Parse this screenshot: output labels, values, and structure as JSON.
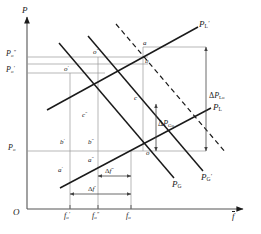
{
  "figure": {
    "type": "economics-supply-demand-diagram",
    "axes": {
      "y_label": "P",
      "x_label": "f",
      "x_label_overbar": true,
      "origin_label": "O"
    },
    "y_ticks": [
      {
        "id": "Po_dprime",
        "base": "P",
        "sub": "o",
        "prime": "″",
        "value_y": 57
      },
      {
        "id": "Po_prime",
        "base": "P",
        "sub": "o",
        "prime": "′",
        "value_y": 73
      },
      {
        "id": "Po",
        "base": "P",
        "sub": "o",
        "prime": "",
        "value_y": 148
      }
    ],
    "x_ticks": [
      {
        "id": "fo_prime",
        "base": "f",
        "sub": "o",
        "prime": "′",
        "value_x": 70
      },
      {
        "id": "fo_dprime",
        "base": "f",
        "sub": "o",
        "prime": "″",
        "value_x": 98
      },
      {
        "id": "fo",
        "base": "f",
        "sub": "o",
        "prime": "",
        "value_x": 131
      }
    ],
    "curves": [
      {
        "name": "PL_prime",
        "label_base": "P",
        "label_sub": "L",
        "label_prime": "′",
        "style": "solid",
        "slope": "upward"
      },
      {
        "name": "PL",
        "label_base": "P",
        "label_sub": "L",
        "label_prime": "",
        "style": "solid",
        "slope": "upward"
      },
      {
        "name": "PG",
        "label_base": "P",
        "label_sub": "G",
        "label_prime": "",
        "style": "solid",
        "slope": "downward"
      },
      {
        "name": "PG_prime",
        "label_base": "P",
        "label_sub": "G",
        "label_prime": "′",
        "style": "solid",
        "slope": "downward"
      },
      {
        "name": "PG_dashed",
        "label_base": "",
        "label_sub": "",
        "label_prime": "",
        "style": "dashed",
        "slope": "downward"
      }
    ],
    "points": [
      {
        "id": "a",
        "base": "a",
        "prime": "",
        "x": 143,
        "y": 47
      },
      {
        "id": "b",
        "base": "b",
        "prime": "",
        "x": 143,
        "y": 63
      },
      {
        "id": "c",
        "base": "c",
        "prime": "",
        "x": 140,
        "y": 100
      },
      {
        "id": "o",
        "base": "o",
        "prime": "",
        "x": 137,
        "y": 151
      },
      {
        "id": "o_prime",
        "base": "o",
        "prime": "′",
        "x": 70,
        "y": 73
      },
      {
        "id": "o_dprime",
        "base": "o",
        "prime": "″",
        "x": 98,
        "y": 57
      },
      {
        "id": "b_prime",
        "base": "b",
        "prime": "′",
        "x": 70,
        "y": 145
      },
      {
        "id": "b_dprime",
        "base": "b",
        "prime": "″",
        "x": 98,
        "y": 145
      },
      {
        "id": "a_prime",
        "base": "a",
        "prime": "′",
        "x": 68,
        "y": 172
      },
      {
        "id": "a_dprime",
        "base": "a",
        "prime": "″",
        "x": 96,
        "y": 163
      },
      {
        "id": "c_dprime",
        "base": "c",
        "prime": "″",
        "x": 88,
        "y": 118
      }
    ],
    "annotations": [
      {
        "id": "delta_P_Lo",
        "delta": "Δ",
        "base": "P",
        "sub": "Lo",
        "kind": "vertical-span"
      },
      {
        "id": "delta_P_Go",
        "delta": "Δ",
        "base": "P",
        "sub": "Go",
        "kind": "vertical-span"
      },
      {
        "id": "delta_f_dprime",
        "delta": "Δ",
        "base": "f",
        "prime": "″",
        "kind": "horizontal-span"
      },
      {
        "id": "delta_f_prime",
        "delta": "Δ",
        "base": "f",
        "prime": "′",
        "kind": "horizontal-span"
      }
    ],
    "colors": {
      "ink": "#1a1a1a",
      "thin_line": "#8a8a8a",
      "background": "#ffffff"
    }
  }
}
